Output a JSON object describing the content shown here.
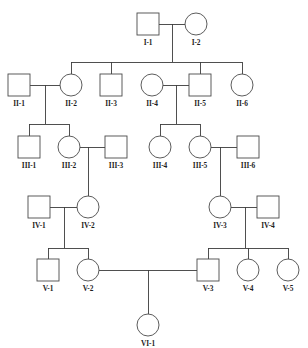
{
  "diagram": {
    "kind": "pedigree-chart",
    "title_note": "",
    "symbol_legend": {
      "square": "male",
      "circle": "female"
    },
    "colors": {
      "line": "#3c3c3c",
      "symbol_stroke": "#4a4a4a",
      "symbol_fill": "#ffffff",
      "label_text": "#1e1e1e",
      "background": "#ffffff"
    },
    "generations": [
      {
        "roman": "I",
        "individuals": [
          {
            "id": "I-1",
            "label": "I-1",
            "sex": "male",
            "shape": "square",
            "x": 148,
            "y": 24
          },
          {
            "id": "I-2",
            "label": "I-2",
            "sex": "female",
            "shape": "circle",
            "x": 196,
            "y": 24
          }
        ]
      },
      {
        "roman": "II",
        "individuals": [
          {
            "id": "II-1",
            "label": "II-1",
            "sex": "male",
            "shape": "square",
            "x": 19,
            "y": 85
          },
          {
            "id": "II-2",
            "label": "II-2",
            "sex": "female",
            "shape": "circle",
            "x": 71,
            "y": 85
          },
          {
            "id": "II-3",
            "label": "II-3",
            "sex": "male",
            "shape": "square",
            "x": 111,
            "y": 85
          },
          {
            "id": "II-4",
            "label": "II-4",
            "sex": "female",
            "shape": "circle",
            "x": 152,
            "y": 85
          },
          {
            "id": "II-5",
            "label": "II-5",
            "sex": "male",
            "shape": "square",
            "x": 200,
            "y": 85
          },
          {
            "id": "II-6",
            "label": "II-6",
            "sex": "female",
            "shape": "circle",
            "x": 242,
            "y": 85
          }
        ]
      },
      {
        "roman": "III",
        "individuals": [
          {
            "id": "III-1",
            "label": "III-1",
            "sex": "male",
            "shape": "square",
            "x": 29,
            "y": 147
          },
          {
            "id": "III-2",
            "label": "III-2",
            "sex": "female",
            "shape": "circle",
            "x": 69,
            "y": 147
          },
          {
            "id": "III-3",
            "label": "III-3",
            "sex": "male",
            "shape": "square",
            "x": 116,
            "y": 147
          },
          {
            "id": "III-4",
            "label": "III-4",
            "sex": "female",
            "shape": "circle",
            "x": 160,
            "y": 147
          },
          {
            "id": "III-5",
            "label": "III-5",
            "sex": "female",
            "shape": "circle",
            "x": 200,
            "y": 147
          },
          {
            "id": "III-6",
            "label": "III-6",
            "sex": "male",
            "shape": "square",
            "x": 248,
            "y": 147
          }
        ]
      },
      {
        "roman": "IV",
        "individuals": [
          {
            "id": "IV-1",
            "label": "IV-1",
            "sex": "male",
            "shape": "square",
            "x": 39,
            "y": 207
          },
          {
            "id": "IV-2",
            "label": "IV-2",
            "sex": "female",
            "shape": "circle",
            "x": 88,
            "y": 207
          },
          {
            "id": "IV-3",
            "label": "IV-3",
            "sex": "female",
            "shape": "circle",
            "x": 220,
            "y": 207
          },
          {
            "id": "IV-4",
            "label": "IV-4",
            "sex": "male",
            "shape": "square",
            "x": 268,
            "y": 207
          }
        ]
      },
      {
        "roman": "V",
        "individuals": [
          {
            "id": "V-1",
            "label": "V-1",
            "sex": "male",
            "shape": "square",
            "x": 48,
            "y": 270
          },
          {
            "id": "V-2",
            "label": "V-2",
            "sex": "female",
            "shape": "circle",
            "x": 88,
            "y": 270
          },
          {
            "id": "V-3",
            "label": "V-3",
            "sex": "male",
            "shape": "square",
            "x": 208,
            "y": 270
          },
          {
            "id": "V-4",
            "label": "V-4",
            "sex": "female",
            "shape": "circle",
            "x": 248,
            "y": 270
          },
          {
            "id": "V-5",
            "label": "V-5",
            "sex": "female",
            "shape": "circle",
            "x": 288,
            "y": 270
          }
        ]
      },
      {
        "roman": "VI",
        "individuals": [
          {
            "id": "VI-1",
            "label": "VI-1",
            "sex": "female",
            "shape": "circle",
            "x": 148,
            "y": 325
          }
        ]
      }
    ],
    "unions": [
      {
        "partners": [
          "I-1",
          "I-2"
        ],
        "children": [
          "II-2",
          "II-3",
          "II-5",
          "II-6"
        ]
      },
      {
        "partners": [
          "II-1",
          "II-2"
        ],
        "children": [
          "III-1",
          "III-2"
        ]
      },
      {
        "partners": [
          "II-4",
          "II-5"
        ],
        "children": [
          "III-4",
          "III-5"
        ]
      },
      {
        "partners": [
          "III-2",
          "III-3"
        ],
        "children": [
          "IV-2"
        ]
      },
      {
        "partners": [
          "III-5",
          "III-6"
        ],
        "children": [
          "IV-3"
        ]
      },
      {
        "partners": [
          "IV-1",
          "IV-2"
        ],
        "children": [
          "V-1",
          "V-2"
        ]
      },
      {
        "partners": [
          "IV-3",
          "IV-4"
        ],
        "children": [
          "V-3",
          "V-4",
          "V-5"
        ]
      },
      {
        "partners": [
          "V-2",
          "V-3"
        ],
        "children": [
          "VI-1"
        ]
      }
    ],
    "counts": {
      "generations": 6,
      "individuals": 24,
      "males": 11,
      "females": 13
    }
  }
}
